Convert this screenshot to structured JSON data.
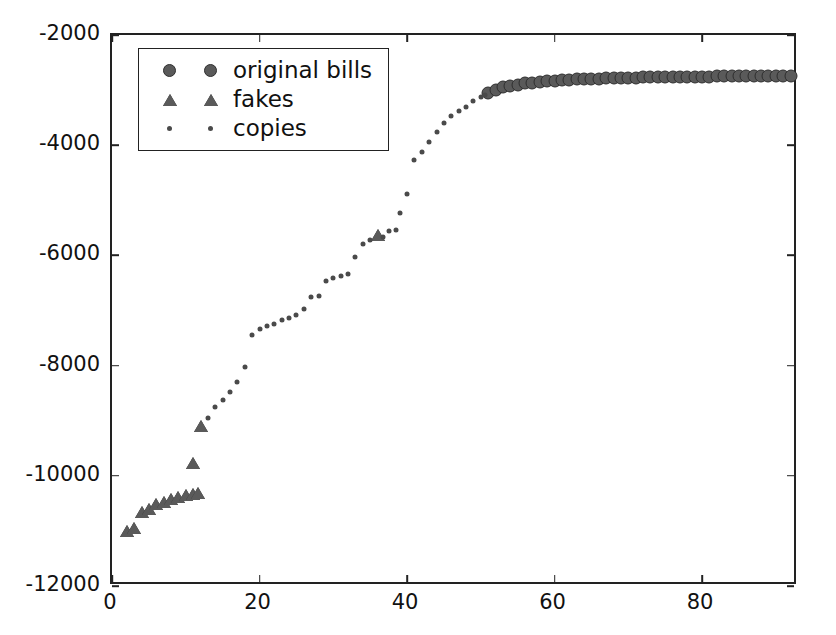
{
  "chart_data": {
    "type": "scatter",
    "title": "",
    "xlabel": "",
    "ylabel": "",
    "xlim": [
      0,
      93
    ],
    "ylim": [
      -12000,
      -2000
    ],
    "xticks": [
      0,
      20,
      40,
      60,
      80
    ],
    "yticks": [
      -12000,
      -10000,
      -8000,
      -6000,
      -4000,
      -2000
    ],
    "xticklabels": [
      "0",
      "20",
      "40",
      "60",
      "80"
    ],
    "yticklabels": [
      "-12000",
      "-10000",
      "-8000",
      "-6000",
      "-4000",
      "-2000"
    ],
    "grid": false,
    "legend_position": "upper left",
    "marker_color": "#5a5a5a",
    "edge_color": "#2e2e2e",
    "axis_color": "#222222",
    "series": [
      {
        "name": "original bills",
        "marker": "circle",
        "marker_size": 13,
        "points": [
          [
            51,
            -3050
          ],
          [
            52,
            -2990
          ],
          [
            53,
            -2950
          ],
          [
            54,
            -2920
          ],
          [
            55,
            -2900
          ],
          [
            56,
            -2880
          ],
          [
            57,
            -2865
          ],
          [
            58,
            -2850
          ],
          [
            59,
            -2838
          ],
          [
            60,
            -2828
          ],
          [
            61,
            -2820
          ],
          [
            62,
            -2812
          ],
          [
            63,
            -2806
          ],
          [
            64,
            -2800
          ],
          [
            65,
            -2795
          ],
          [
            66,
            -2790
          ],
          [
            67,
            -2786
          ],
          [
            68,
            -2782
          ],
          [
            69,
            -2779
          ],
          [
            70,
            -2776
          ],
          [
            71,
            -2773
          ],
          [
            72,
            -2770
          ],
          [
            73,
            -2768
          ],
          [
            74,
            -2766
          ],
          [
            75,
            -2764
          ],
          [
            76,
            -2762
          ],
          [
            77,
            -2760
          ],
          [
            78,
            -2758
          ],
          [
            79,
            -2757
          ],
          [
            80,
            -2756
          ],
          [
            81,
            -2754
          ],
          [
            82,
            -2753
          ],
          [
            83,
            -2752
          ],
          [
            84,
            -2751
          ],
          [
            85,
            -2750
          ],
          [
            86,
            -2749
          ],
          [
            87,
            -2748
          ],
          [
            88,
            -2747
          ],
          [
            89,
            -2746
          ],
          [
            90,
            -2746
          ],
          [
            91,
            -2745
          ],
          [
            92,
            -2745
          ]
        ]
      },
      {
        "name": "fakes",
        "marker": "triangle",
        "marker_size": 14,
        "points": [
          [
            2,
            -11000
          ],
          [
            3,
            -10950
          ],
          [
            4,
            -10650
          ],
          [
            5,
            -10600
          ],
          [
            6,
            -10520
          ],
          [
            7,
            -10470
          ],
          [
            8,
            -10430
          ],
          [
            9,
            -10390
          ],
          [
            10,
            -10350
          ],
          [
            11,
            -10330
          ],
          [
            11.6,
            -10320
          ],
          [
            11,
            -9760
          ],
          [
            12,
            -9100
          ],
          [
            36,
            -5630
          ]
        ]
      },
      {
        "name": "copies",
        "marker": "dot",
        "marker_size": 5,
        "points": [
          [
            13,
            -8960
          ],
          [
            14,
            -8760
          ],
          [
            15,
            -8620
          ],
          [
            16,
            -8480
          ],
          [
            17,
            -8300
          ],
          [
            18,
            -8020
          ],
          [
            19,
            -7450
          ],
          [
            20,
            -7330
          ],
          [
            21,
            -7290
          ],
          [
            22,
            -7250
          ],
          [
            23,
            -7180
          ],
          [
            24,
            -7140
          ],
          [
            25,
            -7090
          ],
          [
            26,
            -6980
          ],
          [
            27,
            -6760
          ],
          [
            28,
            -6740
          ],
          [
            29,
            -6470
          ],
          [
            30,
            -6410
          ],
          [
            31,
            -6370
          ],
          [
            32,
            -6330
          ],
          [
            33,
            -6020
          ],
          [
            34,
            -5790
          ],
          [
            35,
            -5720
          ],
          [
            36.8,
            -5660
          ],
          [
            37.5,
            -5560
          ],
          [
            38.5,
            -5530
          ],
          [
            39,
            -5230
          ],
          [
            40,
            -4890
          ],
          [
            41,
            -4260
          ],
          [
            42,
            -4120
          ],
          [
            43,
            -3950
          ],
          [
            44,
            -3760
          ],
          [
            45,
            -3600
          ],
          [
            46,
            -3470
          ],
          [
            47,
            -3380
          ],
          [
            48,
            -3300
          ],
          [
            49,
            -3200
          ],
          [
            50,
            -3120
          ],
          [
            50.6,
            -3080
          ]
        ]
      }
    ]
  },
  "legend": {
    "entries": [
      {
        "label": "original bills",
        "marker": "circle"
      },
      {
        "label": "fakes",
        "marker": "triangle"
      },
      {
        "label": "copies",
        "marker": "dot"
      }
    ]
  }
}
